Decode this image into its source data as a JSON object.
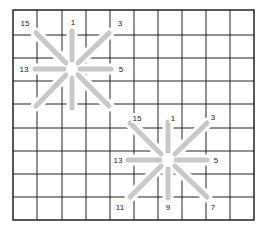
{
  "diagram": {
    "type": "stitch-grid",
    "grid": {
      "columns": 10,
      "rows": 9,
      "line_color": "#222222",
      "background": "#ffffff"
    },
    "arm_color": "#c8c8c8",
    "stars": [
      {
        "name": "star-1",
        "labels": {
          "top_left": "15",
          "top": "1",
          "top_right": "3",
          "left": "13",
          "right": "5"
        }
      },
      {
        "name": "star-2",
        "labels": {
          "top_left": "15",
          "top": "1",
          "top_right": "3",
          "left": "13",
          "right": "5",
          "bottom_left": "11",
          "bottom": "9",
          "bottom_right": "7"
        }
      }
    ]
  }
}
